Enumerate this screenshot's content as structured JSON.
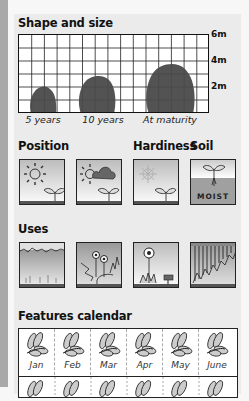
{
  "sections": {
    "shape_size": {
      "title": "Shape and size",
      "y_labels": [
        "6m",
        "4m",
        "2m"
      ],
      "x_labels": [
        "5 years",
        "10 years",
        "At maturity"
      ],
      "heights_m": [
        2.2,
        3.2,
        4.1
      ]
    },
    "position": {
      "title": "Position",
      "icons": [
        "full-sun-icon",
        "partial-shade-icon"
      ]
    },
    "hardiness": {
      "title": "Hardiness",
      "icons": [
        "frost-hardy-icon"
      ]
    },
    "soil": {
      "title": "Soil",
      "label": "MOIST"
    },
    "uses": {
      "title": "Uses",
      "icons": [
        "hedge-icon",
        "border-icon",
        "specimen-icon",
        "screen-icon"
      ]
    },
    "features_calendar": {
      "title": "Features calendar",
      "months_row1": [
        "Jan",
        "Feb",
        "Mar",
        "Apr",
        "May",
        "June"
      ]
    }
  }
}
